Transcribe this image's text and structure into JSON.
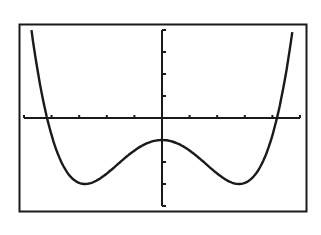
{
  "colors": {
    "ink": "#1a1a1a",
    "background": "#ffffff"
  },
  "chart_data": {
    "type": "line",
    "title": "",
    "xlabel": "",
    "ylabel": "",
    "xlim": [
      -5,
      5
    ],
    "ylim": [
      -4,
      4
    ],
    "x_tick_step": 1,
    "y_tick_step": 1,
    "grid": false,
    "legend": null,
    "series": [
      {
        "name": "f(x)",
        "x": [
          -4.73,
          -4.5,
          -4.2,
          -4.0,
          -3.5,
          -3.0,
          -2.8,
          -2.5,
          -2.0,
          -1.5,
          -1.0,
          -0.5,
          0,
          0.5,
          1.0,
          1.5,
          2.0,
          2.5,
          2.8,
          3.0,
          3.5,
          4.0,
          4.2,
          4.5,
          4.73
        ],
        "y": [
          4.0,
          2.1,
          0.0,
          -0.78,
          -2.35,
          -2.95,
          -3.0,
          -2.92,
          -2.52,
          -1.99,
          -1.48,
          -1.13,
          -1.0,
          -1.13,
          -1.48,
          -1.99,
          -2.52,
          -2.92,
          -3.0,
          -2.95,
          -2.35,
          -0.78,
          0.0,
          2.1,
          4.0
        ]
      }
    ],
    "features": {
      "local_max": [
        0,
        -1
      ],
      "local_min": [
        [
          -2.8,
          -3
        ],
        [
          2.8,
          -3
        ]
      ],
      "x_intercepts": [
        -4.2,
        4.2
      ]
    }
  }
}
